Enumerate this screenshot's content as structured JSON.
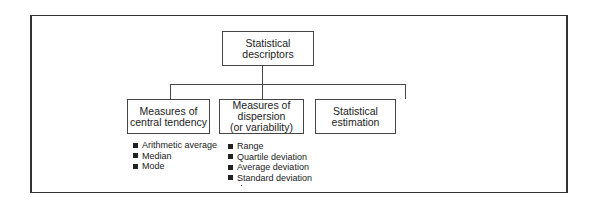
{
  "diagram": {
    "root": {
      "label": "Statistical descriptors",
      "lines": [
        "Statistical",
        "descriptors"
      ]
    },
    "children": [
      {
        "label": "Measures of central tendency",
        "lines": [
          "Measures of",
          "central tendency"
        ],
        "items": [
          "Arithmetic average",
          "Median",
          "Mode"
        ]
      },
      {
        "label": "Measures of dispersion (or variability)",
        "lines": [
          "Measures of",
          "dispersion",
          "(or variability)"
        ],
        "items": [
          "Range",
          "Quartile deviation",
          "Average deviation",
          "Standard deviation"
        ]
      },
      {
        "label": "Statistical estimation",
        "lines": [
          "Statistical",
          "estimation"
        ],
        "items": []
      }
    ],
    "bullet_icon": "filled-square"
  }
}
